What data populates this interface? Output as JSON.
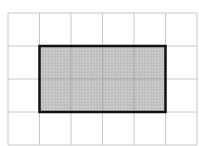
{
  "grid": {
    "columns": 6,
    "rows": 4,
    "origin_x": 8,
    "origin_y": 13,
    "cell_width": 31.5,
    "cell_height": 33,
    "line_color": "#c8c8c8"
  },
  "shaded_rectangle": {
    "col_start": 1,
    "row_start": 1,
    "col_span": 4,
    "row_span": 2,
    "fill_color": "#c4c4c4",
    "border_color": "#111111",
    "border_width": 2.5
  }
}
